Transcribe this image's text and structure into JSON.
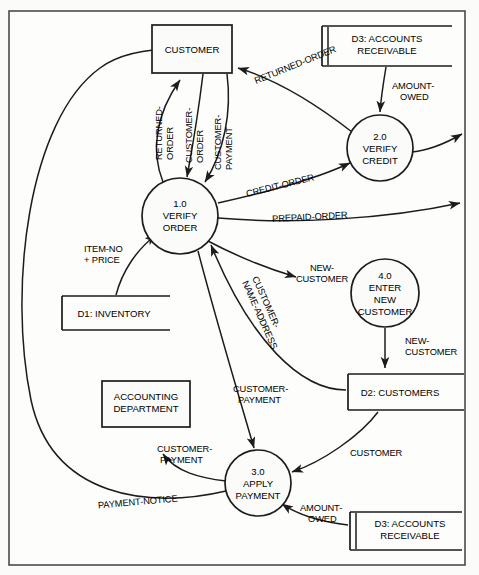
{
  "diagram": {
    "type": "data-flow-diagram",
    "colors": {
      "background": "#fbfbfa",
      "stroke": "#1c1c1c",
      "frame": "#4a4a4a"
    },
    "external_entities": [
      {
        "id": "customer",
        "label": "CUSTOMER",
        "x": 192,
        "y": 49,
        "w": 80,
        "h": 48
      },
      {
        "id": "accounting",
        "label_line1": "ACCOUNTING",
        "label_line2": "DEPARTMENT",
        "x": 146,
        "y": 404,
        "w": 88,
        "h": 46
      }
    ],
    "processes": [
      {
        "id": "p1",
        "number": "1.0",
        "line1": "VERIFY",
        "line2": "ORDER",
        "cx": 180,
        "cy": 216,
        "r": 38
      },
      {
        "id": "p2",
        "number": "2.0",
        "line1": "VERIFY",
        "line2": "CREDIT",
        "cx": 380,
        "cy": 148,
        "r": 33
      },
      {
        "id": "p3",
        "number": "3.0",
        "line1": "APPLY",
        "line2": "PAYMENT",
        "cx": 258,
        "cy": 483,
        "r": 33
      },
      {
        "id": "p4",
        "number": "4.0",
        "line1": "ENTER",
        "line2": "NEW",
        "line3": "CUSTOMER",
        "cx": 385,
        "cy": 293,
        "r": 34
      }
    ],
    "data_stores": [
      {
        "id": "d3top",
        "label_line1": "D3: ACCOUNTS",
        "label_line2": "RECEIVABLE",
        "x": 322,
        "y": 26,
        "w": 130,
        "h": 40,
        "double_left": true
      },
      {
        "id": "d1",
        "label": "D1: INVENTORY",
        "x": 62,
        "y": 296,
        "w": 108,
        "h": 34,
        "double_left": false
      },
      {
        "id": "d2",
        "label": "D2: CUSTOMERS",
        "x": 348,
        "y": 374,
        "w": 116,
        "h": 36,
        "double_left": false
      },
      {
        "id": "d3bottom",
        "label_line1": "D3: ACCOUNTS",
        "label_line2": "RECEIVABLE",
        "x": 350,
        "y": 512,
        "w": 118,
        "h": 38,
        "double_left": true
      }
    ],
    "flows": [
      {
        "id": "f-returned-order-c",
        "label": "RETURNED-​ORDER",
        "from": "p1",
        "to": "customer",
        "orientation": "vertical-rotated"
      },
      {
        "id": "f-customer-order",
        "label": "CUSTOMER-​ORDER",
        "from": "customer",
        "to": "p1",
        "orientation": "vertical-rotated"
      },
      {
        "id": "f-customer-payment-top",
        "label": "CUSTOMER-​PAYMENT",
        "from": "customer",
        "to": "p1",
        "orientation": "vertical-rotated"
      },
      {
        "id": "f-returned-order-2",
        "label": "RETURNED-ORDER",
        "from": "p2",
        "to": "customer",
        "orientation": "diagonal"
      },
      {
        "id": "f-amount-owed-top",
        "label_line1": "AMOUNT-",
        "label_line2": "OWED",
        "from": "d3top",
        "to": "p2",
        "orientation": "horizontal"
      },
      {
        "id": "f-credit-order",
        "label": "CREDIT-ORDER",
        "from": "p1",
        "to": "p2",
        "orientation": "diagonal"
      },
      {
        "id": "f-prepaid-order",
        "label": "PREPAID-ORDER",
        "from": "p1",
        "to": "out-right",
        "orientation": "horizontal"
      },
      {
        "id": "f-p2-out",
        "label": "",
        "from": "p2",
        "to": "out-right",
        "orientation": "horizontal"
      },
      {
        "id": "f-new-customer-1",
        "label_line1": "NEW-",
        "label_line2": "CUSTOMER",
        "from": "p1",
        "to": "p4",
        "orientation": "horizontal"
      },
      {
        "id": "f-new-customer-2",
        "label_line1": "NEW-",
        "label_line2": "CUSTOMER",
        "from": "p4",
        "to": "d2",
        "orientation": "horizontal"
      },
      {
        "id": "f-customer-name-address",
        "label": "CUSTOMER-​NAME-ADDRESS",
        "from": "d2",
        "to": "p1",
        "orientation": "diagonal-rotated"
      },
      {
        "id": "f-item-no-price",
        "label_line1": "ITEM-NO",
        "label_line2": "+ PRICE",
        "from": "d1",
        "to": "p1",
        "orientation": "horizontal"
      },
      {
        "id": "f-customer-payment-mid",
        "label_line1": "CUSTOMER-",
        "label_line2": "PAYMENT",
        "from": "p1",
        "to": "p3",
        "orientation": "horizontal"
      },
      {
        "id": "f-customer-payment-acct",
        "label_line1": "CUSTOMER-",
        "label_line2": "PAYMENT",
        "from": "p3",
        "to": "accounting",
        "orientation": "horizontal"
      },
      {
        "id": "f-payment-notice",
        "label": "PAYMENT-NOTICE",
        "from": "p3",
        "to": "customer",
        "orientation": "horizontal"
      },
      {
        "id": "f-customer-store",
        "label": "CUSTOMER",
        "from": "d2",
        "to": "p3",
        "orientation": "horizontal"
      },
      {
        "id": "f-amount-owed-bottom",
        "label_line1": "AMOUNT-",
        "label_line2": "OWED",
        "from": "d3bottom",
        "to": "p3",
        "orientation": "horizontal"
      }
    ]
  },
  "labels": {
    "returned_order": "RETURNED-",
    "returned_order_2": "ORDER",
    "customer_order": "CUSTOMER-",
    "customer_order_2": "ORDER",
    "customer_payment": "CUSTOMER-",
    "customer_payment_2": "PAYMENT",
    "returned_order_full": "RETURNED-ORDER",
    "amount_owed_1": "AMOUNT-",
    "amount_owed_2": "OWED",
    "credit_order": "CREDIT-ORDER",
    "prepaid_order": "PREPAID-ORDER",
    "new_customer_1": "NEW-",
    "new_customer_2": "CUSTOMER",
    "new_customer_3": "NEW-",
    "new_customer_4": "CUSTOMER",
    "customer_name_address_1": "CUSTOMER-",
    "customer_name_address_2": "NAME-ADDRESS",
    "item_no": "ITEM-NO",
    "plus_price": "+ PRICE",
    "customer_payment_mid_1": "CUSTOMER-",
    "customer_payment_mid_2": "PAYMENT",
    "customer_payment_acct_1": "CUSTOMER-",
    "customer_payment_acct_2": "PAYMENT",
    "payment_notice": "PAYMENT-NOTICE",
    "customer_flow": "CUSTOMER",
    "amount_owed_b1": "AMOUNT-",
    "amount_owed_b2": "OWED"
  },
  "nodes": {
    "customer_entity": "CUSTOMER",
    "accounting_1": "ACCOUNTING",
    "accounting_2": "DEPARTMENT",
    "p1_num": "1.0",
    "p1_l1": "VERIFY",
    "p1_l2": "ORDER",
    "p2_num": "2.0",
    "p2_l1": "VERIFY",
    "p2_l2": "CREDIT",
    "p3_num": "3.0",
    "p3_l1": "APPLY",
    "p3_l2": "PAYMENT",
    "p4_num": "4.0",
    "p4_l1": "ENTER",
    "p4_l2": "NEW",
    "p4_l3": "CUSTOMER",
    "d3top_1": "D3: ACCOUNTS",
    "d3top_2": "RECEIVABLE",
    "d1_label": "D1: INVENTORY",
    "d2_label": "D2: CUSTOMERS",
    "d3bot_1": "D3: ACCOUNTS",
    "d3bot_2": "RECEIVABLE"
  }
}
